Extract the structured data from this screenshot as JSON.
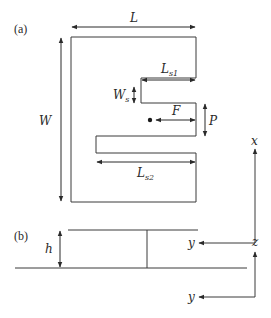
{
  "figure": {
    "panels": [
      {
        "id": "a",
        "label": "(a)",
        "view": "top view"
      },
      {
        "id": "b",
        "label": "(b)",
        "view": "side view"
      }
    ],
    "dimensions": {
      "L": {
        "main": "L",
        "sub": ""
      },
      "W": {
        "main": "W",
        "sub": ""
      },
      "Ls1": {
        "main": "L",
        "sub": "s1"
      },
      "Ls2": {
        "main": "L",
        "sub": "s2"
      },
      "Ws": {
        "main": "W",
        "sub": "s"
      },
      "F": {
        "main": "F",
        "sub": ""
      },
      "P": {
        "main": "P",
        "sub": ""
      },
      "h": {
        "main": "h",
        "sub": ""
      }
    },
    "axes_a": {
      "vertical": "x",
      "horizontal": "y"
    },
    "axes_b": {
      "vertical": "z",
      "horizontal": "y"
    },
    "colors": {
      "line": "#3a3a3a",
      "text": "#2a2a2a",
      "background": "#ffffff"
    }
  }
}
